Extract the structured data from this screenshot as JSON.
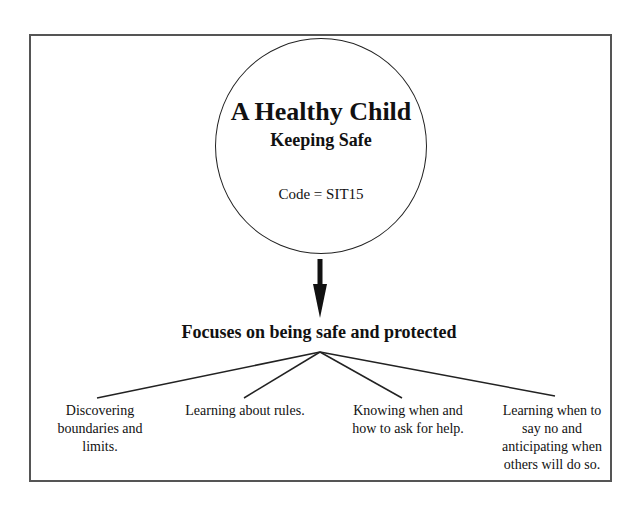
{
  "diagram": {
    "circle": {
      "title": "A Healthy Child",
      "subtitle": "Keeping Safe",
      "code": "Code = SIT15"
    },
    "focus_heading": "Focuses on being safe and protected",
    "branches": [
      {
        "label": "Discovering boundaries and limits."
      },
      {
        "label": "Learning about rules."
      },
      {
        "label": "Knowing when and how to ask for help."
      },
      {
        "label": "Learning when to say no and anticipating when others will do so."
      }
    ]
  }
}
